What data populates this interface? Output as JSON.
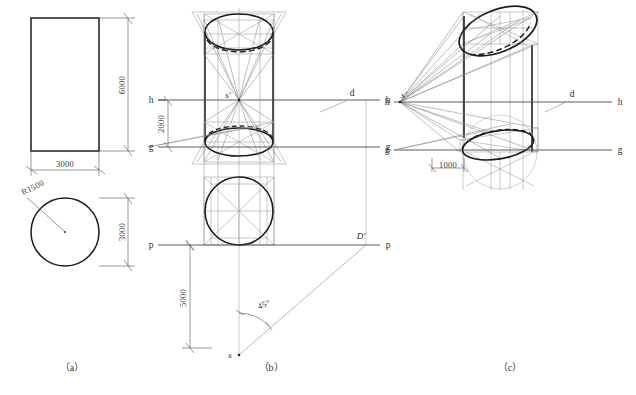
{
  "figure": {
    "background_color": "#ffffff",
    "ink_color": "#1c1c1c",
    "construction_color": "#8a8a8a",
    "dimension_color": "#555555"
  },
  "panels": [
    {
      "id": "a",
      "caption": "（a）",
      "description": "Orthographic views: elevation rectangle and plan circle",
      "labels": {
        "height": "6000",
        "width": "3000",
        "plan_depth": "3000",
        "radius": "R1500"
      }
    },
    {
      "id": "b",
      "caption": "（b）",
      "description": "One-point perspective construction of an upright cylinder",
      "labels": {
        "horizon_left": "h",
        "horizon_right": "h",
        "ground_left": "g",
        "ground_right": "g",
        "picture_left": "p",
        "picture_right": "p",
        "station_point": "s",
        "vanishing_point": "s′",
        "distance_point": "d",
        "diagonal_point": "D′",
        "eye_height": "2000",
        "station_distance": "5000",
        "angle": "45°"
      }
    },
    {
      "id": "c",
      "caption": "（c）",
      "description": "Resulting perspective view of the cylinder",
      "labels": {
        "horizon_left": "h",
        "horizon_right": "h",
        "ground_left": "g",
        "ground_right": "g",
        "vanishing_point": "s′",
        "distance_point": "d",
        "offset": "1000"
      }
    }
  ]
}
